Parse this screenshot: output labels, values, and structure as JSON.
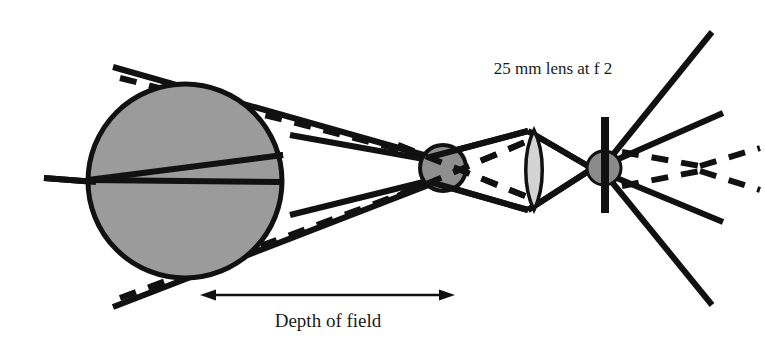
{
  "figure": {
    "type": "optical-ray-diagram",
    "canvas": {
      "width": 765,
      "height": 346,
      "background": "#ffffff"
    }
  },
  "labels": {
    "lens_spec": "25 mm lens at f 2",
    "depth_of_field": "Depth of field"
  },
  "colors": {
    "ink": "#111111",
    "subject_sphere_fill": "#9b9b9b",
    "blur_circle_fill": "#8f8f8f",
    "lens_fill": "#d3d3d3",
    "image_circle_fill": "#8a8a8a",
    "background": "#ffffff",
    "text": "#1a1a1a"
  },
  "geometry": {
    "subject_sphere": {
      "cx": 185,
      "cy": 181,
      "r": 97,
      "stroke_width": 5
    },
    "blur_circle": {
      "cx": 443,
      "cy": 168,
      "r": 23,
      "stroke_width": 4
    },
    "lens": {
      "cx": 534,
      "cy": 170,
      "half_height": 40,
      "half_width": 11
    },
    "film_plane": {
      "x": 605,
      "y_top": 117,
      "y_bottom": 213,
      "width": 8
    },
    "image_circle": {
      "cx": 604,
      "cy": 168,
      "r": 17
    },
    "axis_point_left": {
      "x": 88,
      "y": 180
    },
    "focus_point_right": {
      "x": 700,
      "y": 168
    }
  },
  "elements": {
    "subject_sphere_name": "subject-sphere",
    "blur_circle_name": "circle-of-confusion",
    "lens_name": "camera-lens",
    "film_plane_name": "film-plane",
    "image_circle_name": "image-blur-circle",
    "dof_arrow_name": "depth-of-field-arrow"
  },
  "dof_arrow": {
    "x_start": 200,
    "x_end": 455,
    "y": 295,
    "head_length": 16,
    "head_width": 11,
    "line_width": 2.5
  },
  "rays": {
    "solid_stroke_width": 6,
    "dashed_stroke_width": 6,
    "dash_pattern": "17 13",
    "solid": [
      {
        "name": "upper-tangent-outer",
        "points": "113,67 452,163"
      },
      {
        "name": "lower-tangent-outer",
        "points": "113,307 452,176"
      },
      {
        "name": "upper-chord-inner",
        "points": "290,135 452,164"
      },
      {
        "name": "lower-chord-inner",
        "points": "290,215 452,175"
      },
      {
        "name": "axis-ray-upper-left",
        "points": "88,180 283,155"
      },
      {
        "name": "axis-ray-lower-left",
        "points": "88,180 283,182"
      },
      {
        "name": "axis-stub-left",
        "points": "44,178 96,182"
      },
      {
        "name": "blur-to-lens-upper",
        "points": "430,157 528,131"
      },
      {
        "name": "blur-to-lens-lower",
        "points": "430,182 528,210"
      },
      {
        "name": "lens-top-to-image",
        "points": "528,131 612,180"
      },
      {
        "name": "lens-bottom-to-image",
        "points": "528,210 612,156"
      },
      {
        "name": "image-out-up-far",
        "points": "607,162 712,32"
      },
      {
        "name": "image-out-up-near",
        "points": "607,164 723,113"
      },
      {
        "name": "image-out-down-near",
        "points": "607,174 723,222"
      },
      {
        "name": "image-out-down-far",
        "points": "607,176 712,305"
      }
    ],
    "dashed": [
      {
        "name": "upper-tangent-dashed",
        "points": "120,78 444,161"
      },
      {
        "name": "lower-tangent-dashed",
        "points": "120,298 444,178"
      },
      {
        "name": "dashed-cross-upper",
        "points": "398,145 530,198"
      },
      {
        "name": "dashed-cross-lower",
        "points": "398,196 530,140"
      },
      {
        "name": "dashed-image-up-in",
        "points": "622,152 700,166"
      },
      {
        "name": "dashed-image-down-in",
        "points": "622,186 700,171"
      },
      {
        "name": "dashed-image-up-out",
        "points": "700,166 760,148"
      },
      {
        "name": "dashed-image-down-out",
        "points": "700,171 760,190"
      }
    ]
  },
  "annotations": {
    "lens_label_position": {
      "x": 553,
      "y": 74,
      "anchor": "middle",
      "font_size": 17
    },
    "dof_label_position": {
      "x": 328,
      "y": 327,
      "anchor": "middle",
      "font_size": 19
    }
  }
}
